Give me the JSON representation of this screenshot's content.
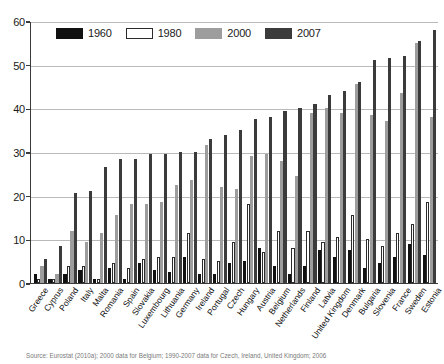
{
  "chart_data": {
    "type": "bar",
    "title": "",
    "xlabel": "",
    "ylabel": "",
    "ylim": [
      0,
      60
    ],
    "yticks": [
      0,
      10,
      20,
      30,
      40,
      50,
      60
    ],
    "grid": true,
    "legend_position": "top-left",
    "categories": [
      "Greece",
      "Cyprus",
      "Poland",
      "Italy",
      "Malta",
      "Romania",
      "Spain",
      "Slovakia",
      "Luxembourg",
      "Lithuania",
      "Germany",
      "Ireland",
      "Portugal",
      "Czech",
      "Hungary",
      "Austria",
      "Belgium",
      "Netherlands",
      "Finland",
      "Latvia",
      "United Kingdom",
      "Denmark",
      "Bulgaria",
      "Slovenia",
      "France",
      "Sweden",
      "Estonia"
    ],
    "series": [
      {
        "name": "1960",
        "color": "#111111",
        "values": [
          2.0,
          1.0,
          2.0,
          3.0,
          1.0,
          3.5,
          1.0,
          4.5,
          3.0,
          2.5,
          6.0,
          2.0,
          2.0,
          4.5,
          5.0,
          8.0,
          4.0,
          2.0,
          4.0,
          7.5,
          6.0,
          7.5,
          3.5,
          4.5,
          6.0,
          9.0,
          6.5
        ]
      },
      {
        "name": "1980",
        "color": "#ffffff",
        "values": [
          1.0,
          1.0,
          4.0,
          4.0,
          1.0,
          4.5,
          3.5,
          5.5,
          6.0,
          6.0,
          11.5,
          5.5,
          5.0,
          9.5,
          18.0,
          7.0,
          12.0,
          8.0,
          12.0,
          9.5,
          10.5,
          15.5,
          10.0,
          8.5,
          11.5,
          13.5,
          18.5
        ]
      },
      {
        "name": "2000",
        "color": "#9d9d9d",
        "values": [
          4.0,
          2.0,
          12.0,
          9.5,
          11.5,
          15.5,
          18.0,
          18.0,
          18.5,
          22.5,
          23.5,
          31.5,
          22.0,
          21.5,
          29.0,
          29.5,
          28.0,
          24.5,
          39.0,
          40.0,
          39.0,
          45.5,
          38.5,
          37.0,
          43.5,
          55.0,
          38.0
        ]
      },
      {
        "name": "2007",
        "color": "#3b3b3b",
        "values": [
          5.5,
          8.5,
          20.5,
          21.0,
          26.5,
          28.5,
          28.5,
          29.5,
          29.5,
          30.0,
          30.0,
          33.0,
          34.0,
          35.0,
          37.5,
          38.0,
          39.5,
          40.0,
          41.0,
          43.0,
          44.0,
          46.0,
          51.0,
          51.5,
          52.0,
          55.5,
          58.0
        ]
      }
    ]
  },
  "legend": {
    "items": [
      {
        "label": "1960"
      },
      {
        "label": "1980"
      },
      {
        "label": "2000"
      },
      {
        "label": "2007"
      }
    ]
  },
  "source": {
    "text": "Source: Eurostat (2010a); 2000 data for Belgium; 1990-2007 data for Czech, Ireland, United Kingdom; 2006"
  }
}
